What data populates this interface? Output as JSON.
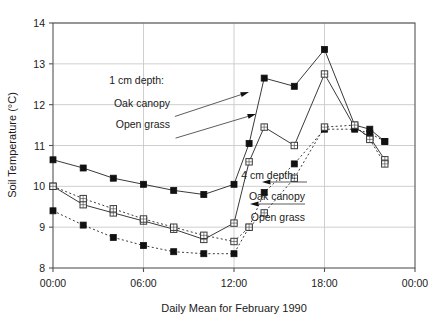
{
  "chart_data": {
    "type": "line",
    "title": "",
    "xlabel": "Daily Mean for February 1990",
    "ylabel": "Soil Temperature (°C)",
    "ylim": [
      8,
      14
    ],
    "yticks": [
      8,
      9,
      10,
      11,
      12,
      13,
      14
    ],
    "ytick_labels": [
      "8",
      "9",
      "10",
      "11",
      "12",
      "13",
      "14"
    ],
    "xlim": [
      0,
      24
    ],
    "xticks": [
      0,
      6,
      12,
      18,
      24
    ],
    "xtick_labels": [
      "00:00",
      "06:00",
      "12:00",
      "18:00",
      "00:00"
    ],
    "grid": true,
    "legend": "inline-annotations",
    "x_unit": "hours",
    "series": [
      {
        "name": "1 cm depth: Oak canopy",
        "depth": "1 cm",
        "site": "Oak canopy",
        "marker": "filled-square",
        "line": "solid",
        "x": [
          0,
          2,
          4,
          6,
          8,
          10,
          12,
          13,
          14,
          16,
          18,
          20,
          21,
          22
        ],
        "values": [
          10.65,
          10.45,
          10.2,
          10.05,
          9.9,
          9.8,
          10.05,
          11.05,
          12.65,
          12.45,
          13.35,
          11.5,
          11.4,
          11.1
        ]
      },
      {
        "name": "1 cm depth: Open grass",
        "depth": "1 cm",
        "site": "Open grass",
        "marker": "open-square",
        "line": "solid",
        "x": [
          0,
          2,
          4,
          6,
          8,
          10,
          12,
          13,
          14,
          16,
          18,
          20,
          21,
          22
        ],
        "values": [
          10.0,
          9.55,
          9.35,
          9.15,
          8.95,
          8.7,
          9.1,
          10.6,
          11.45,
          11.0,
          12.75,
          11.45,
          11.2,
          10.65
        ]
      },
      {
        "name": "4 cm depth: Oak canopy",
        "depth": "4 cm",
        "site": "Oak canopy",
        "marker": "filled-square",
        "line": "dotted",
        "x": [
          0,
          2,
          4,
          6,
          8,
          10,
          12,
          13,
          14,
          16,
          18,
          20,
          21,
          22
        ],
        "values": [
          9.4,
          9.05,
          8.75,
          8.55,
          8.4,
          8.35,
          8.35,
          9.0,
          9.85,
          10.55,
          11.4,
          11.4,
          11.3,
          11.1
        ]
      },
      {
        "name": "4 cm depth: Open grass",
        "depth": "4 cm",
        "site": "Open grass",
        "marker": "open-square",
        "line": "dotted",
        "x": [
          0,
          2,
          4,
          6,
          8,
          10,
          12,
          13,
          14,
          16,
          18,
          20,
          21,
          22
        ],
        "values": [
          10.0,
          9.7,
          9.45,
          9.2,
          9.0,
          8.8,
          8.65,
          9.0,
          9.35,
          10.2,
          11.45,
          11.5,
          11.15,
          10.55
        ]
      }
    ],
    "annotations": [
      {
        "id": "ann-1cm-header",
        "text": "1 cm depth:",
        "x": 164,
        "y": 84
      },
      {
        "id": "ann-1cm-oak",
        "text": "Oak canopy",
        "x": 170,
        "y": 107
      },
      {
        "id": "ann-1cm-grass",
        "text": "Open grass",
        "x": 170,
        "y": 128
      },
      {
        "id": "ann-4cm-header",
        "text": "4 cm depth:",
        "x": 296,
        "y": 179
      },
      {
        "id": "ann-4cm-oak",
        "text": "Oak canopy",
        "x": 305,
        "y": 200
      },
      {
        "id": "ann-4cm-grass",
        "text": "Open grass",
        "x": 305,
        "y": 221
      }
    ]
  },
  "colors": {
    "line": "#3a3a3a",
    "marker_fill": "#111111",
    "marker_open_fill": "#ffffff",
    "grid": "#c9c9c9",
    "axis": "#555555",
    "text": "#1a1a1a",
    "background": "#ffffff"
  }
}
